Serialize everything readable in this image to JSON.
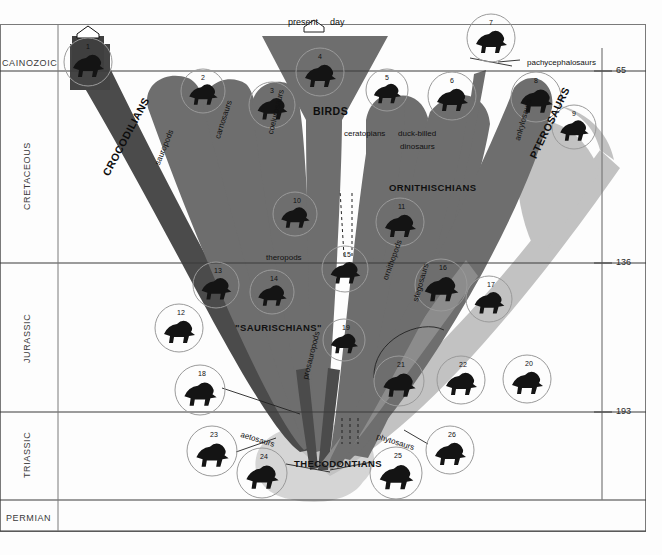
{
  "figure": {
    "title_icon": "home-pentagon-icon",
    "present_day_label_left": "present",
    "present_day_label_right": "day",
    "background": "#fdfdfd",
    "colors": {
      "dark_branch": "#4b4b4b",
      "mid_branch": "#6e6e6e",
      "light_branch": "#a9a9a9",
      "pale_branch": "#c9c9c9",
      "base_fill": "#d5d5d5",
      "axis_line": "#2b2b2b",
      "grid_line": "#555555",
      "circle_stroke": "#9a9a9a",
      "silhouette": "#141414"
    }
  },
  "time_axis": {
    "ticks": [
      {
        "value": "65",
        "y": 71
      },
      {
        "value": "136",
        "y": 263
      },
      {
        "value": "193",
        "y": 412
      }
    ],
    "unit_hint": ""
  },
  "eras": [
    {
      "name": "CAINOZOIC",
      "orientation": "horizontal",
      "x": 2,
      "y": 58
    },
    {
      "name": "CRETACEOUS",
      "orientation": "vertical",
      "x": 22,
      "y": 210
    },
    {
      "name": "JURASSIC",
      "orientation": "vertical",
      "x": 22,
      "y": 363
    },
    {
      "name": "TRIASSIC",
      "orientation": "vertical",
      "x": 22,
      "y": 478
    },
    {
      "name": "PERMIAN",
      "orientation": "horizontal",
      "x": 6,
      "y": 513
    }
  ],
  "major_clades": [
    {
      "label": "CROCODILIANS",
      "x": 100,
      "y": 172,
      "rotate": 62,
      "style": "bigcap"
    },
    {
      "label": "BIRDS",
      "x": 313,
      "y": 105,
      "rotate": 0,
      "style": "bigcap"
    },
    {
      "label": "ORNITHISCHIANS",
      "x": 389,
      "y": 182,
      "rotate": 0,
      "style": "midcap"
    },
    {
      "label": "PTEROSAURS",
      "x": 527,
      "y": 155,
      "rotate": 64,
      "style": "bigcap"
    },
    {
      "label": "\"SAURISCHIANS\"",
      "x": 235,
      "y": 322,
      "rotate": 0,
      "style": "midcap"
    },
    {
      "label": "THECODONTIANS",
      "x": 294,
      "y": 458,
      "rotate": 0,
      "style": "midcap"
    }
  ],
  "group_labels": [
    {
      "label": "sauropods",
      "x": 153,
      "y": 163,
      "rotate": 68
    },
    {
      "label": "carnosaurs",
      "x": 213,
      "y": 137,
      "rotate": 72
    },
    {
      "label": "coelurosaurs",
      "x": 266,
      "y": 133,
      "rotate": 76
    },
    {
      "label": "theropods",
      "x": 266,
      "y": 253,
      "rotate": 0
    },
    {
      "label": "ceratopians",
      "x": 344,
      "y": 129,
      "rotate": 0
    },
    {
      "label": "duck-billed",
      "x": 398,
      "y": 129,
      "rotate": 0
    },
    {
      "label": "dinosaurs",
      "x": 400,
      "y": 142,
      "rotate": 0
    },
    {
      "label": "pachycephalosaurs",
      "x": 527,
      "y": 58,
      "rotate": 0
    },
    {
      "label": "ankylosaurs",
      "x": 513,
      "y": 139,
      "rotate": 74
    },
    {
      "label": "ornithopods",
      "x": 381,
      "y": 278,
      "rotate": 70
    },
    {
      "label": "stegosaurs",
      "x": 411,
      "y": 300,
      "rotate": 74
    },
    {
      "label": "prosauropods",
      "x": 301,
      "y": 378,
      "rotate": 76
    },
    {
      "label": "aetosaurs",
      "x": 242,
      "y": 430,
      "rotate": -17
    },
    {
      "label": "phytosaurs",
      "x": 378,
      "y": 432,
      "rotate": -17
    }
  ],
  "specimens": [
    {
      "n": "1",
      "cx": 88,
      "cy": 62,
      "r": 24,
      "icon": "crocodile-head-silhouette"
    },
    {
      "n": "2",
      "cx": 203,
      "cy": 91,
      "r": 22,
      "icon": "tyrannosaur-silhouette"
    },
    {
      "n": "3",
      "cx": 272,
      "cy": 105,
      "r": 23,
      "icon": "sauropod-silhouette"
    },
    {
      "n": "4",
      "cx": 320,
      "cy": 72,
      "r": 24,
      "icon": "bird-silhouette"
    },
    {
      "n": "5",
      "cx": 387,
      "cy": 90,
      "r": 21,
      "icon": "ceratopsian-silhouette"
    },
    {
      "n": "6",
      "cx": 452,
      "cy": 96,
      "r": 24,
      "icon": "hadrosaur-silhouette"
    },
    {
      "n": "7",
      "cx": 491,
      "cy": 38,
      "r": 24,
      "icon": "pachycephalosaur-head-silhouette"
    },
    {
      "n": "8",
      "cx": 536,
      "cy": 97,
      "r": 25,
      "icon": "ankylosaur-silhouette"
    },
    {
      "n": "9",
      "cx": 574,
      "cy": 127,
      "r": 22,
      "icon": "pterosaur-silhouette"
    },
    {
      "n": "10",
      "cx": 295,
      "cy": 214,
      "r": 22,
      "icon": "coelurosaur-silhouette"
    },
    {
      "n": "11",
      "cx": 400,
      "cy": 222,
      "r": 24,
      "icon": "iguanodon-silhouette"
    },
    {
      "n": "12",
      "cx": 179,
      "cy": 328,
      "r": 24,
      "icon": "plesiosaur-silhouette"
    },
    {
      "n": "13",
      "cx": 216,
      "cy": 285,
      "r": 23,
      "icon": "sauropod2-silhouette"
    },
    {
      "n": "14",
      "cx": 272,
      "cy": 292,
      "r": 22,
      "icon": "theropod2-silhouette"
    },
    {
      "n": "15",
      "cx": 345,
      "cy": 269,
      "r": 23,
      "icon": "archaeopteryx-silhouette"
    },
    {
      "n": "16",
      "cx": 441,
      "cy": 285,
      "r": 26,
      "icon": "stegosaur-silhouette"
    },
    {
      "n": "17",
      "cx": 489,
      "cy": 299,
      "r": 23,
      "icon": "pterodactyl-silhouette"
    },
    {
      "n": "18",
      "cx": 200,
      "cy": 390,
      "r": 25,
      "icon": "prosauropod-hand-silhouette"
    },
    {
      "n": "19",
      "cx": 344,
      "cy": 340,
      "r": 21,
      "icon": "small-theropod-silhouette"
    },
    {
      "n": "20",
      "cx": 527,
      "cy": 379,
      "r": 24,
      "icon": "crocodilian-silhouette"
    },
    {
      "n": "21",
      "cx": 399,
      "cy": 381,
      "r": 25,
      "icon": "early-pterosaur-silhouette"
    },
    {
      "n": "22",
      "cx": 461,
      "cy": 380,
      "r": 24,
      "icon": "ornithosuchian-silhouette"
    },
    {
      "n": "23",
      "cx": 212,
      "cy": 451,
      "r": 25,
      "icon": "aetosaur-silhouette"
    },
    {
      "n": "24",
      "cx": 262,
      "cy": 473,
      "r": 25,
      "icon": "thecodont-silhouette"
    },
    {
      "n": "25",
      "cx": 396,
      "cy": 473,
      "r": 26,
      "icon": "phytosaur-silhouette"
    },
    {
      "n": "26",
      "cx": 450,
      "cy": 450,
      "r": 24,
      "icon": "phytosaur2-silhouette"
    }
  ]
}
